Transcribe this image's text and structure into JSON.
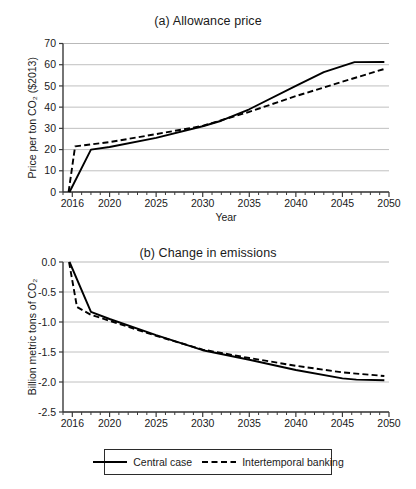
{
  "figure": {
    "background": "#ffffff",
    "line_color": "#000000",
    "grid_color": "#b9b9b9",
    "axis_color": "#3a3a3a"
  },
  "legend": {
    "position": "bottom-center",
    "entries": [
      {
        "label": "Central case",
        "style": "solid",
        "swatch": "solid-line-swatch"
      },
      {
        "label": "Intertemporal banking",
        "style": "dashed",
        "swatch": "dashed-line-swatch"
      }
    ]
  },
  "chart_data": [
    {
      "type": "line",
      "panel": "a",
      "title": "(a) Allowance price",
      "xlabel": "Year",
      "ylabel": "Price per ton CO₂ ($2013)",
      "xlim": [
        2015,
        2050
      ],
      "ylim": [
        0,
        70
      ],
      "xticks": [
        2016,
        2020,
        2025,
        2030,
        2035,
        2040,
        2045,
        2050
      ],
      "xtick_labels": [
        "2016",
        "2020",
        "2025",
        "2030",
        "2035",
        "2040",
        "2045",
        "2050"
      ],
      "minor_xtick_interval": 1,
      "yticks": [
        0,
        10,
        20,
        30,
        40,
        50,
        60,
        70
      ],
      "ytick_labels": [
        "0",
        "10",
        "20",
        "30",
        "40",
        "50",
        "60",
        "70"
      ],
      "grid": "horizontal",
      "legend": "shared-bottom",
      "series": [
        {
          "name": "Central case",
          "style": "solid",
          "x": [
            2015.7,
            2018,
            2020,
            2025,
            2030,
            2032,
            2035,
            2040,
            2043,
            2046.3,
            2049.5
          ],
          "values": [
            0,
            20.0,
            21.2,
            25.5,
            31.0,
            33.6,
            39.0,
            50.0,
            56.5,
            61.2,
            61.3
          ]
        },
        {
          "name": "Intertemporal banking",
          "style": "dashed",
          "x": [
            2015.6,
            2016.3,
            2020,
            2025,
            2028,
            2030,
            2035,
            2040,
            2045,
            2049.5
          ],
          "values": [
            0,
            21.5,
            23.5,
            27.3,
            29.6,
            31.2,
            37.8,
            45.2,
            52.0,
            58.0
          ]
        }
      ]
    },
    {
      "type": "line",
      "panel": "b",
      "title": "(b) Change in emissions",
      "xlabel": "Year",
      "ylabel": "Billion metric tons of  CO₂",
      "xlim": [
        2015,
        2050
      ],
      "ylim": [
        -2.5,
        0.0
      ],
      "xticks": [
        2016,
        2020,
        2025,
        2030,
        2035,
        2040,
        2045,
        2050
      ],
      "xtick_labels": [
        "2016",
        "2020",
        "2025",
        "2030",
        "2035",
        "2040",
        "2045",
        "2050"
      ],
      "minor_xtick_interval": 1,
      "yticks": [
        0.0,
        -0.5,
        -1.0,
        -1.5,
        -2.0,
        -2.5
      ],
      "ytick_labels": [
        "0.0",
        "-0.5",
        "-1.0",
        "-1.5",
        "-2.0",
        "-2.5"
      ],
      "grid": "horizontal",
      "legend": "shared-bottom",
      "series": [
        {
          "name": "Central case",
          "style": "solid",
          "x": [
            2015.7,
            2018,
            2020,
            2025,
            2030,
            2035,
            2040,
            2045,
            2046.5,
            2049.5
          ],
          "values": [
            0.0,
            -0.83,
            -0.95,
            -1.22,
            -1.47,
            -1.63,
            -1.8,
            -1.94,
            -1.96,
            -1.97
          ]
        },
        {
          "name": "Intertemporal banking",
          "style": "dashed",
          "x": [
            2015.65,
            2016.5,
            2018,
            2020,
            2025,
            2030,
            2035,
            2040,
            2045,
            2049.5
          ],
          "values": [
            0.0,
            -0.75,
            -0.88,
            -0.98,
            -1.23,
            -1.46,
            -1.6,
            -1.73,
            -1.84,
            -1.9
          ]
        }
      ]
    }
  ]
}
